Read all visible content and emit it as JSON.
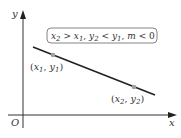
{
  "diagram": {
    "axes": {
      "x_label": "x",
      "y_label": "y",
      "origin_label": "O"
    },
    "condition_box": {
      "parts": [
        {
          "var": "x",
          "sub": "2"
        },
        {
          "text": " > "
        },
        {
          "var": "x",
          "sub": "1"
        },
        {
          "text": ", "
        },
        {
          "var": "y",
          "sub": "2"
        },
        {
          "text": " < "
        },
        {
          "var": "y",
          "sub": "1"
        },
        {
          "text": ", "
        },
        {
          "var": "m"
        },
        {
          "text": " < 0"
        }
      ],
      "text": "x2 > x1, y2 < y1, m < 0"
    },
    "points": [
      {
        "label": "(x1, y1)",
        "var1": "x",
        "sub1": "1",
        "var2": "y",
        "sub2": "1"
      },
      {
        "label": "(x2, y2)",
        "var1": "x",
        "sub1": "2",
        "var2": "y",
        "sub2": "2"
      }
    ],
    "colors": {
      "line": "#222222",
      "point": "#a0a0a0",
      "box_border": "#555555",
      "text": "#333333"
    }
  }
}
